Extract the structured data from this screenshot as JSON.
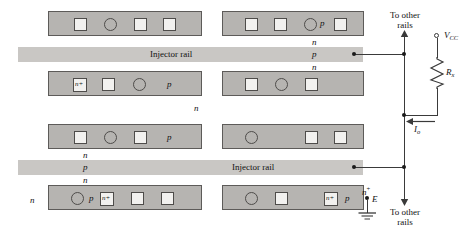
{
  "figure": {
    "title_text": "",
    "colors": {
      "strip_fill": "#b6b4b1",
      "strip_border": "#5d5b59",
      "contact_fill": "#f2f1ef",
      "rail_fill": "#c9c7c4",
      "wire": "#3a3a3a",
      "text": "#111111"
    }
  },
  "rails": [
    {
      "id": "rail-top",
      "label": "Injector rail"
    },
    {
      "id": "rail-bottom",
      "label": "Injector rail"
    }
  ],
  "strips": [
    {
      "id": "strip-top-left",
      "contacts": [
        "square",
        "circle",
        "square",
        "square"
      ],
      "contact_labels": [
        "",
        "",
        "",
        ""
      ],
      "region_label": ""
    },
    {
      "id": "strip-top-right",
      "contacts": [
        "square",
        "square",
        "circle",
        "square"
      ],
      "contact_labels": [
        "",
        "",
        "",
        ""
      ],
      "region_label": "p"
    },
    {
      "id": "strip-second-left",
      "contacts": [
        "square",
        "square",
        "circle"
      ],
      "contact_labels": [
        "n+",
        "",
        ""
      ],
      "region_label": "p"
    },
    {
      "id": "strip-second-right",
      "contacts": [
        "square",
        "circle",
        "square"
      ],
      "contact_labels": [
        "",
        "",
        ""
      ],
      "region_label": ""
    },
    {
      "id": "strip-third-left",
      "contacts": [
        "square",
        "circle",
        "square"
      ],
      "contact_labels": [
        "",
        "",
        ""
      ],
      "region_label": "p"
    },
    {
      "id": "strip-third-right",
      "contacts": [
        "circle",
        "square",
        "square"
      ],
      "contact_labels": [
        "",
        "",
        ""
      ],
      "region_label": ""
    },
    {
      "id": "strip-bottom-left",
      "contacts": [
        "circle",
        "square",
        "square",
        "square"
      ],
      "contact_labels": [
        "",
        "n+",
        "",
        ""
      ],
      "region_label": "p"
    },
    {
      "id": "strip-bottom-right",
      "contacts": [
        "circle",
        "square",
        "square"
      ],
      "contact_labels": [
        "",
        "",
        "n+"
      ],
      "region_label": "p"
    }
  ],
  "layer_labels": {
    "top_stack": [
      "n",
      "p",
      "n"
    ],
    "bottom_stack": [
      "n",
      "p",
      "n"
    ],
    "isolated_n_middle": "n",
    "isolated_n_left": "n"
  },
  "circuit": {
    "to_other_rails_top": "To other\nrails",
    "to_other_rails_top_line1": "To other",
    "to_other_rails_top_line2": "rails",
    "to_other_rails_bottom_line1": "To other",
    "to_other_rails_bottom_line2": "rails",
    "supply_label": "V",
    "supply_sub": "CC",
    "resistor_label": "R",
    "resistor_sub": "x",
    "current_label": "I",
    "current_sub": "o",
    "ground_label": "E",
    "ground_region": "n",
    "ground_region_sup": "+"
  }
}
